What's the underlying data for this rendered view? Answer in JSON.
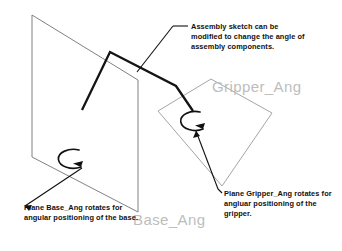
{
  "diagram": {
    "background_color": "#ffffff",
    "line_color": "#6e6e6e",
    "sketch_color": "#111111",
    "label_color": "#bdbdbd",
    "text_color": "#101010",
    "planes": [
      {
        "id": "base-plane",
        "label": "Base_Ang",
        "shape": "parallelogram",
        "points": "32,15 138,80 138,212 32,157"
      },
      {
        "id": "gripper-plane",
        "label": "Gripper_Ang",
        "shape": "tilted-rectangle",
        "points": "211,79 272,113 222,186 158,111"
      }
    ],
    "rotation_arrows": [
      {
        "id": "base-rotation-arrow",
        "center_x": 68,
        "center_y": 160
      },
      {
        "id": "gripper-rotation-arrow",
        "center_x": 190,
        "center_y": 122
      }
    ],
    "assembly_sketch": {
      "id": "assembly-sketch-polyline",
      "points": "82,110 110,52 176,86 193,111"
    }
  },
  "callouts": {
    "assembly": {
      "text": "Assembly sketch can be modified to change the angle of assembly components."
    },
    "base": {
      "text": "Plane Base_Ang rotates for angular positioning of the base."
    },
    "gripper": {
      "text": "Plane Gripper_Ang rotates for angluar positioning of the gripper."
    }
  },
  "labels": {
    "base_plane": "Base_Ang",
    "gripper_plane": "Gripper_Ang"
  }
}
